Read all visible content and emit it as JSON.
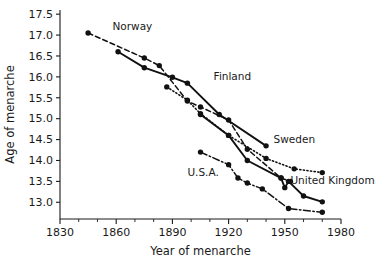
{
  "chart_data": {
    "type": "line",
    "title": "",
    "xlabel": "Year of menarche",
    "ylabel": "Age of menarche",
    "xlim": [
      1830,
      1980
    ],
    "ylim": [
      12.6,
      17.6
    ],
    "grid": false,
    "legend_position": "inline-annotations",
    "x_ticks": [
      1830,
      1860,
      1890,
      1920,
      1950,
      1980
    ],
    "x_tick_labels": [
      "1830",
      "1860",
      "1890",
      "1920",
      "1950",
      "1980"
    ],
    "x_minor_step": 10,
    "y_ticks": [
      13.0,
      13.5,
      14.0,
      14.5,
      15.0,
      15.5,
      16.0,
      16.5,
      17.0,
      17.5
    ],
    "y_tick_labels": [
      "13.0",
      "13.5",
      "14.0",
      "14.5",
      "15.0",
      "15.5",
      "16.0",
      "16.5",
      "17.0",
      "17.5"
    ],
    "series": [
      {
        "name": "Norway",
        "label": "Norway",
        "style": "dashed",
        "dash": "5,3",
        "label_x": 1858,
        "label_y": 17.12,
        "points": [
          {
            "x": 1845,
            "y": 17.05
          },
          {
            "x": 1875,
            "y": 16.45
          },
          {
            "x": 1883,
            "y": 16.27
          },
          {
            "x": 1898,
            "y": 15.42
          },
          {
            "x": 1905,
            "y": 15.28
          },
          {
            "x": 1920,
            "y": 14.97
          },
          {
            "x": 1930,
            "y": 14.27
          },
          {
            "x": 1948,
            "y": 13.58
          },
          {
            "x": 1953,
            "y": 13.5
          }
        ]
      },
      {
        "name": "Finland",
        "label": "Finland",
        "style": "solid",
        "dash": "none",
        "label_x": 1912,
        "label_y": 15.92,
        "points": [
          {
            "x": 1861,
            "y": 16.6
          },
          {
            "x": 1875,
            "y": 16.22
          },
          {
            "x": 1890,
            "y": 15.99
          },
          {
            "x": 1898,
            "y": 15.85
          },
          {
            "x": 1915,
            "y": 15.1
          },
          {
            "x": 1940,
            "y": 14.35
          }
        ]
      },
      {
        "name": "Sweden",
        "label": "Sweden",
        "style": "dotted",
        "dash": "1.2,2.4",
        "label_x": 1944,
        "label_y": 14.42,
        "points": [
          {
            "x": 1887,
            "y": 15.76
          },
          {
            "x": 1898,
            "y": 15.44
          },
          {
            "x": 1905,
            "y": 15.12
          },
          {
            "x": 1920,
            "y": 14.6
          },
          {
            "x": 1940,
            "y": 14.05
          },
          {
            "x": 1955,
            "y": 13.8
          },
          {
            "x": 1970,
            "y": 13.71
          }
        ]
      },
      {
        "name": "United Kingdom",
        "label": "United Kingdom",
        "style": "solid",
        "dash": "none",
        "label_x": 1953,
        "label_y": 13.44,
        "points": [
          {
            "x": 1905,
            "y": 15.1
          },
          {
            "x": 1920,
            "y": 14.6
          },
          {
            "x": 1930,
            "y": 14.0
          },
          {
            "x": 1948,
            "y": 13.58
          },
          {
            "x": 1950,
            "y": 13.35
          },
          {
            "x": 1952,
            "y": 13.5
          },
          {
            "x": 1960,
            "y": 13.15
          },
          {
            "x": 1970,
            "y": 13.01
          }
        ]
      },
      {
        "name": "U.S.A.",
        "label": "U.S.A.",
        "style": "dashdot",
        "dash": "7,2.5,1.5,2.5",
        "label_x": 1898,
        "label_y": 13.62,
        "points": [
          {
            "x": 1905,
            "y": 14.2
          },
          {
            "x": 1920,
            "y": 13.9
          },
          {
            "x": 1925,
            "y": 13.58
          },
          {
            "x": 1930,
            "y": 13.46
          },
          {
            "x": 1938,
            "y": 13.32
          },
          {
            "x": 1952,
            "y": 12.85
          },
          {
            "x": 1970,
            "y": 12.76
          }
        ]
      }
    ]
  }
}
